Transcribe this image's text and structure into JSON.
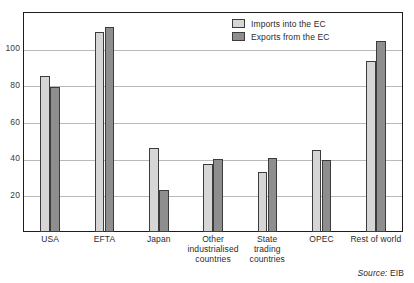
{
  "chart_data": {
    "type": "bar",
    "title": "",
    "subtitle": "",
    "xlabel": "",
    "ylabel": "",
    "ylim": [
      0,
      120
    ],
    "yticks": [
      20,
      40,
      60,
      80,
      100
    ],
    "grid": true,
    "legend_position": "top-right",
    "categories": [
      "USA",
      "EFTA",
      "Japan",
      "Other industrialised countries",
      "State trading countries",
      "OPEC",
      "Rest of world"
    ],
    "category_lines": [
      [
        "USA"
      ],
      [
        "EFTA"
      ],
      [
        "Japan"
      ],
      [
        "Other",
        "industrialised",
        "countries"
      ],
      [
        "State",
        "trading",
        "countries"
      ],
      [
        "OPEC"
      ],
      [
        "Rest of world"
      ]
    ],
    "series": [
      {
        "name": "Imports into the EC",
        "color": "#d6d6d6",
        "values": [
          85,
          109,
          46,
          37,
          33,
          44.5,
          93.5
        ]
      },
      {
        "name": "Exports from the EC",
        "color": "#8e8e8e",
        "values": [
          79,
          112,
          23,
          40,
          40.5,
          39.5,
          104
        ]
      }
    ]
  },
  "legend": {
    "items": [
      {
        "label": "Imports into the EC",
        "swatch": "imports"
      },
      {
        "label": "Exports from the EC",
        "swatch": "exports"
      }
    ]
  },
  "source": {
    "label": "Source:",
    "value": "EIB"
  },
  "colors": {
    "imports": "#d6d6d6",
    "exports": "#8e8e8e",
    "bar_outline": "#3c3c3c",
    "grid": "#b9b9b9",
    "frame": "#1d1d1d",
    "text": "#2b2b2b",
    "background": "#ffffff"
  }
}
